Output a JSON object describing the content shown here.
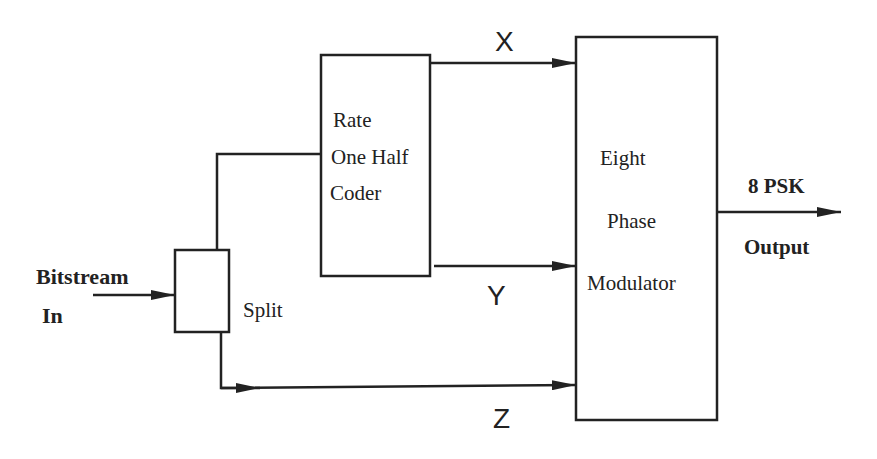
{
  "diagram": {
    "title": "",
    "input": {
      "line1": "Bitstream",
      "line2": "In"
    },
    "blocks": {
      "split": {
        "label": "Split"
      },
      "coder": {
        "line1": "Rate",
        "line2": "One Half",
        "line3": "Coder"
      },
      "modulator": {
        "line1": "Eight",
        "line2": "Phase",
        "line3": "Modulator"
      }
    },
    "signals": {
      "x": "X",
      "y": "Y",
      "z": "Z"
    },
    "output": {
      "line1": "8 PSK",
      "line2": "Output"
    },
    "colors": {
      "stroke": "#222222",
      "background": "#ffffff"
    }
  }
}
